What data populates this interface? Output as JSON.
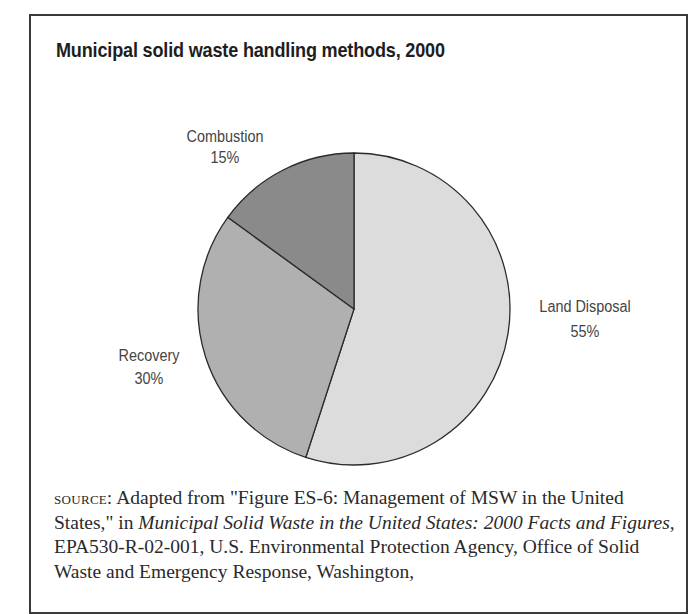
{
  "figure_header": "FIGURE 2.5",
  "title": "Municipal solid waste handling methods, 2000",
  "chart_data": {
    "type": "pie",
    "title": "Municipal solid waste handling methods, 2000",
    "categories": [
      "Land Disposal",
      "Recovery",
      "Combustion"
    ],
    "values": [
      55,
      30,
      15
    ],
    "unit": "%",
    "start_angle": "12 o'clock, clockwise",
    "colors": [
      "#dcdcdc",
      "#b0b0b0",
      "#8a8a8a"
    ],
    "labels": [
      {
        "name": "Land Disposal",
        "pct": "55%"
      },
      {
        "name": "Recovery",
        "pct": "30%"
      },
      {
        "name": "Combustion",
        "pct": "15%"
      }
    ],
    "legend": "none (direct labels)"
  },
  "source": {
    "label": "source:",
    "text_1": " Adapted from \"Figure ES-6: Management of MSW in the United States,\" in ",
    "italic_1": "Municipal Solid Waste in the United States: 2000 Facts and Figures",
    "text_2": ", EPA530-R-02-001, U.S. Environmental Protection Agency, Office of Solid Waste and Emergency Response, Washington,"
  }
}
